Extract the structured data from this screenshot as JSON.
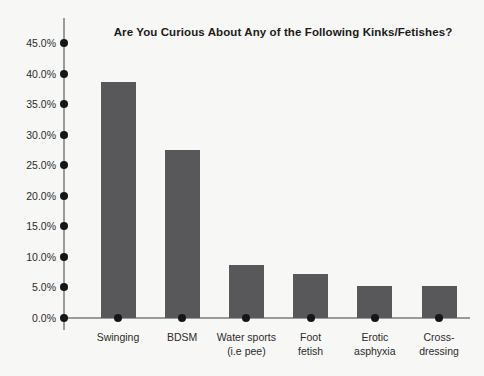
{
  "chart_data": {
    "type": "bar",
    "title": "Are You Curious About Any of the Following Kinks/Fetishes?",
    "xlabel": "",
    "ylabel": "",
    "categories": [
      "Swinging",
      "Water sports (i.e pee)",
      "BDSM",
      "Foot fetish",
      "Erotic asphyxia",
      "Cross-dressing"
    ],
    "category_lines": [
      [
        "Swinging"
      ],
      [
        "BDSM"
      ],
      [
        "Water sports",
        "(i.e pee)"
      ],
      [
        "Foot",
        "fetish"
      ],
      [
        "Erotic",
        "asphyxia"
      ],
      [
        "Cross-",
        "dressing"
      ]
    ],
    "values": [
      38.6,
      27.5,
      8.7,
      7.2,
      5.2,
      5.2
    ],
    "value_labels": [
      "38.6%",
      "27.5%",
      "8.7%",
      "7.2%",
      "5.2%",
      "5.2%"
    ],
    "ylim": [
      0,
      45
    ],
    "ytick_values": [
      0,
      5,
      10,
      15,
      20,
      25,
      30,
      35,
      40,
      45
    ],
    "ytick_labels": [
      "0.0%",
      "5.0%",
      "10.0%",
      "15.0%",
      "20.0%",
      "25.0%",
      "30.0%",
      "35.0%",
      "40.0%",
      "45.0%"
    ],
    "grid": false,
    "legend": false,
    "legend_position": "none",
    "bar_color": "#58585a",
    "axis_color": "#9a9a9a",
    "marker_color": "#161616",
    "text_color": "#2b2b2b",
    "background_color": "#f7f7f5"
  }
}
